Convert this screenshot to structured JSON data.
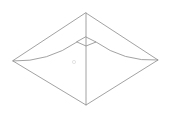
{
  "figure": {
    "background_color": "#ffffff",
    "line_color": "#8a8a8a",
    "faint_line_color": "#d8d8d8",
    "stroke_width": 0.8,
    "canvas": {
      "width": 172,
      "height": 122
    }
  },
  "geometry": {
    "outer_vertices": {
      "top": {
        "x": 86,
        "y": 13
      },
      "right": {
        "x": 158,
        "y": 60
      },
      "bottom": {
        "x": 86,
        "y": 105
      },
      "left": {
        "x": 13,
        "y": 61
      }
    },
    "hub_diamond_vertices": {
      "top": {
        "x": 86,
        "y": 37
      },
      "right": {
        "x": 96,
        "y": 42
      },
      "bottom": {
        "x": 86,
        "y": 46
      },
      "left": {
        "x": 77,
        "y": 42
      }
    },
    "center_spine": {
      "x1": 86,
      "y1": 13,
      "x2": 86,
      "y2": 105
    },
    "left_curve": {
      "start_x": 13,
      "start_y": 61,
      "ctrl_x": 48,
      "ctrl_y": 62,
      "end_x": 77,
      "end_y": 42
    },
    "right_curve": {
      "start_x": 158,
      "start_y": 60,
      "ctrl_x": 124,
      "ctrl_y": 62,
      "end_x": 96,
      "end_y": 42
    },
    "faint_interior_mark": {
      "x": 74,
      "y": 62
    }
  },
  "chart_data": {
    "type": "line",
    "xlabel": "",
    "ylabel": "",
    "xlim": [
      0,
      172
    ],
    "ylim": [
      122,
      0
    ],
    "grid": false,
    "legend": "none",
    "series": [
      {
        "name": "outer-outline",
        "closed": true,
        "x": [
          86,
          158,
          86,
          13
        ],
        "y": [
          13,
          60,
          105,
          61
        ]
      },
      {
        "name": "center-spine",
        "closed": false,
        "x": [
          86,
          86
        ],
        "y": [
          13,
          105
        ]
      },
      {
        "name": "hub-diamond",
        "closed": true,
        "x": [
          86,
          96,
          86,
          77
        ],
        "y": [
          37,
          42,
          46,
          42
        ]
      },
      {
        "name": "left-ridge-curve",
        "closed": false,
        "x": [
          13,
          48,
          77
        ],
        "y": [
          61,
          62,
          42
        ]
      },
      {
        "name": "right-ridge-curve",
        "closed": false,
        "x": [
          158,
          124,
          96
        ],
        "y": [
          60,
          62,
          42
        ]
      }
    ]
  }
}
